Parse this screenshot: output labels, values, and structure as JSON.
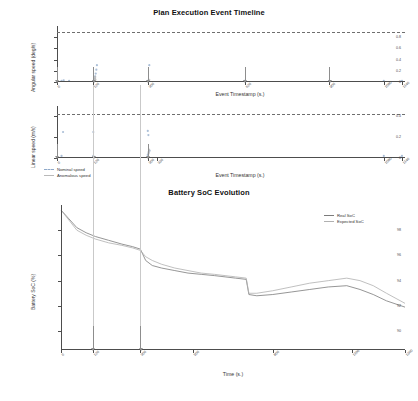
{
  "figure": {
    "width": 418,
    "height": 401,
    "background": "#ffffff"
  },
  "panels": {
    "top": {
      "title": "Plan Execution Event Timeline",
      "ylabel": "Angular speed (deg/s)",
      "xlabel": "Event Timestamp (s.)"
    },
    "middle": {
      "ylabel": "Linear speed (m/s)",
      "xlabel": "Event Timestamp (s.)"
    },
    "bottom": {
      "title": "Battery SoC Evolution",
      "ylabel": "Battery SoC (%)",
      "xlabel": "Time (s.)"
    }
  },
  "legends": {
    "speed": {
      "items": [
        {
          "label": "Nominal speed",
          "color": "#8fa9c9",
          "style": "dashed"
        },
        {
          "label": "Anomalous speed",
          "color": "#b9b9b9",
          "style": "solid"
        }
      ]
    },
    "soc": {
      "items": [
        {
          "label": "Real SoC",
          "color": "#7b7b7b",
          "style": "solid"
        },
        {
          "label": "Expected SoC",
          "color": "#b0b0b0",
          "style": "solid"
        }
      ]
    }
  },
  "chart_data": [
    {
      "type": "scatter",
      "id": "angular-speed-timeline",
      "title": "Plan Execution Event Timeline",
      "xlabel": "Event Timestamp (s.)",
      "ylabel": "Angular speed (deg/s)",
      "ylim": [
        0,
        1.0
      ],
      "xlim": [
        0,
        1150
      ],
      "grid": false,
      "threshold": {
        "value": 0.9,
        "style": "dashed",
        "color": "#6f6f6f"
      },
      "yticks": [
        0.0,
        0.2,
        0.4,
        0.6,
        0.8
      ],
      "yticklabels": [
        "0",
        "0.2",
        "0.4",
        "0.6",
        "0.8"
      ],
      "xticks": [
        0,
        120,
        300,
        620,
        900,
        1080,
        1140
      ],
      "xticklabels": [
        "0",
        "120",
        "300",
        "620",
        "900",
        "1080",
        "1140"
      ],
      "series": [
        {
          "name": "Nominal speed",
          "color": "#8fa9c9",
          "points": [
            {
              "x": 15,
              "y": 0.02
            },
            {
              "x": 22,
              "y": 0.03
            },
            {
              "x": 40,
              "y": 0.02
            },
            {
              "x": 120,
              "y": 0.02
            },
            {
              "x": 124,
              "y": 0.06
            },
            {
              "x": 126,
              "y": 0.1
            },
            {
              "x": 128,
              "y": 0.15
            },
            {
              "x": 130,
              "y": 0.22
            },
            {
              "x": 132,
              "y": 0.3
            },
            {
              "x": 300,
              "y": 0.02
            },
            {
              "x": 305,
              "y": 0.3
            },
            {
              "x": 620,
              "y": 0.02
            },
            {
              "x": 900,
              "y": 0.02
            },
            {
              "x": 1080,
              "y": 0.02
            },
            {
              "x": 1140,
              "y": 0.02
            }
          ]
        },
        {
          "name": "Anomalous speed",
          "color": "#b9b9b9",
          "points": [
            {
              "x": 126,
              "y": 0.05
            },
            {
              "x": 126,
              "y": 0.07
            },
            {
              "x": 126,
              "y": 0.09
            },
            {
              "x": 127,
              "y": 0.04
            },
            {
              "x": 305,
              "y": 0.04
            }
          ]
        }
      ],
      "event_markers": [
        0,
        120,
        300,
        620,
        900
      ]
    },
    {
      "type": "scatter",
      "id": "linear-speed-timeline",
      "xlabel": "Event Timestamp (s.)",
      "ylabel": "Linear speed (m/s)",
      "ylim": [
        0,
        0.5
      ],
      "xlim": [
        0,
        1150
      ],
      "grid": false,
      "threshold": {
        "value": 0.42,
        "style": "dashed",
        "color": "#6f6f6f"
      },
      "yticks": [
        0.0,
        0.2,
        0.4
      ],
      "yticklabels": [
        "0",
        "0.2",
        "0.4"
      ],
      "xticks": [
        0,
        120,
        300,
        330,
        1080,
        1140
      ],
      "xticklabels": [
        "0",
        "120",
        "300",
        "330",
        "1080",
        "1140"
      ],
      "series": [
        {
          "name": "Nominal speed",
          "color": "#8fa9c9",
          "points": [
            {
              "x": 20,
              "y": 0.25
            },
            {
              "x": 120,
              "y": 0.25
            },
            {
              "x": 300,
              "y": 0.26
            },
            {
              "x": 302,
              "y": 0.22
            },
            {
              "x": 15,
              "y": 0.02
            },
            {
              "x": 120,
              "y": 0.02
            },
            {
              "x": 300,
              "y": 0.03
            },
            {
              "x": 303,
              "y": 0.05
            },
            {
              "x": 306,
              "y": 0.07
            },
            {
              "x": 1080,
              "y": 0.02
            },
            {
              "x": 1140,
              "y": 0.02
            }
          ]
        },
        {
          "name": "Anomalous speed",
          "color": "#b9b9b9",
          "points": [
            {
              "x": 302,
              "y": 0.04
            },
            {
              "x": 303,
              "y": 0.06
            },
            {
              "x": 304,
              "y": 0.08
            }
          ]
        }
      ],
      "event_markers": [
        0,
        120,
        300
      ]
    },
    {
      "type": "line",
      "id": "battery-soc-evolution",
      "title": "Battery SoC Evolution",
      "xlabel": "Time (s.)",
      "ylabel": "Battery SoC (%)",
      "xlim": [
        0,
        1300
      ],
      "ylim": [
        88.5,
        100
      ],
      "grid": false,
      "yticks": [
        90,
        92,
        94,
        96,
        98
      ],
      "yticklabels": [
        "90",
        "92",
        "94",
        "96",
        "98"
      ],
      "xticks": [
        0,
        120,
        300,
        500,
        800,
        1100,
        1300
      ],
      "xticklabels": [
        "0",
        "120",
        "300",
        "500",
        "800",
        "1100",
        "1300"
      ],
      "event_markers": [
        120,
        300
      ],
      "series": [
        {
          "name": "Real SoC",
          "color": "#7b7b7b",
          "x": [
            0,
            30,
            60,
            95,
            130,
            180,
            230,
            270,
            300,
            320,
            345,
            380,
            430,
            480,
            530,
            580,
            620,
            660,
            700,
            710,
            740,
            800,
            870,
            940,
            1010,
            1080,
            1130,
            1180,
            1230,
            1300
          ],
          "y": [
            99.6,
            98.9,
            98.2,
            97.8,
            97.5,
            97.2,
            96.9,
            96.7,
            96.5,
            95.6,
            95.2,
            95.0,
            94.8,
            94.6,
            94.5,
            94.4,
            94.3,
            94.2,
            94.1,
            92.9,
            92.8,
            92.9,
            93.1,
            93.3,
            93.5,
            93.6,
            93.3,
            92.9,
            92.4,
            91.9
          ]
        },
        {
          "name": "Expected SoC",
          "color": "#b0b0b0",
          "x": [
            0,
            30,
            60,
            95,
            130,
            180,
            230,
            270,
            300,
            320,
            345,
            380,
            430,
            480,
            530,
            580,
            620,
            660,
            700,
            710,
            740,
            800,
            870,
            940,
            1010,
            1080,
            1130,
            1180,
            1230,
            1300
          ],
          "y": [
            99.6,
            98.8,
            98.0,
            97.6,
            97.3,
            97.0,
            96.8,
            96.6,
            96.4,
            95.9,
            95.6,
            95.3,
            95.0,
            94.8,
            94.6,
            94.5,
            94.4,
            94.3,
            94.2,
            93.0,
            93.0,
            93.2,
            93.5,
            93.8,
            94.0,
            94.2,
            94.0,
            93.6,
            93.0,
            92.2
          ]
        }
      ]
    }
  ]
}
